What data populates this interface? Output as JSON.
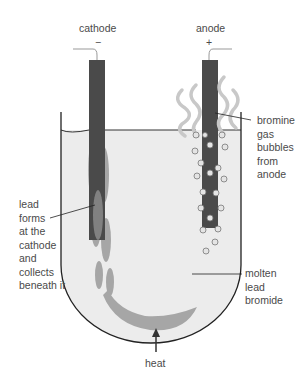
{
  "diagram": {
    "labels": {
      "cathode": "cathode",
      "cathode_sign": "−",
      "anode": "anode",
      "anode_sign": "+",
      "bromine": "bromine\ngas\nbubbles\nfrom\nanode",
      "lead": "lead\nforms\nat the\ncathode\nand\ncollects\nbeneath it",
      "molten": "molten\nlead\nbromide",
      "heat": "heat"
    },
    "colors": {
      "electrode": "#4a4a4a",
      "electrolyte": "#ededed",
      "lead": "#a8a8a8",
      "bromine_gas": "#c8c8c8",
      "outline": "#222222"
    }
  }
}
